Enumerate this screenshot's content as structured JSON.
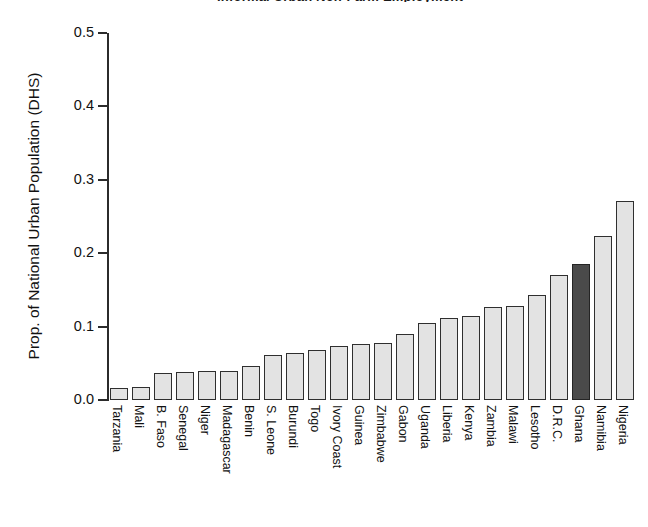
{
  "figure": {
    "title": "Informal Urban Non-Farm Employment",
    "title_clipped": true,
    "ylabel": "Prop. of National Urban Population (DHS)"
  },
  "axis": {
    "yticks": [
      "0.0",
      "0.1",
      "0.2",
      "0.3",
      "0.4",
      "0.5"
    ]
  },
  "chart_data": {
    "type": "bar",
    "title": "Informal Urban Non-Farm Employment",
    "xlabel": "",
    "ylabel": "Prop. of National Urban Population (DHS)",
    "ylim": [
      0.0,
      0.5
    ],
    "grid": false,
    "legend": "none",
    "orientation": "vertical",
    "sorted": "ascending",
    "highlight": {
      "category": "Ghana",
      "color": "#4a4a4a",
      "note": "Ghana bar is filled dark grey; all other bars are light grey"
    },
    "colors": {
      "bar_fill": "#e3e3e3",
      "bar_edge": "#2f2f2f",
      "highlight_fill": "#4a4a4a",
      "background": "#ffffff",
      "text": "#111111"
    },
    "categories": [
      "Tarzania",
      "Mali",
      "B. Faso",
      "Senegal",
      "Niger",
      "Madagascar",
      "Benin",
      "S. Leone",
      "Burundi",
      "Togo",
      "Ivory Coast",
      "Guinea",
      "Zimbabwe",
      "Gabon",
      "Uganda",
      "Liberia",
      "Kenya",
      "Zambia",
      "Malawi",
      "Lesotho",
      "D.R.C.",
      "Ghana",
      "Namibia",
      "Nigeria"
    ],
    "values": [
      0.017,
      0.018,
      0.037,
      0.038,
      0.039,
      0.04,
      0.046,
      0.062,
      0.064,
      0.068,
      0.074,
      0.076,
      0.077,
      0.09,
      0.105,
      0.112,
      0.114,
      0.127,
      0.128,
      0.143,
      0.17,
      0.185,
      0.224,
      0.271
    ]
  }
}
